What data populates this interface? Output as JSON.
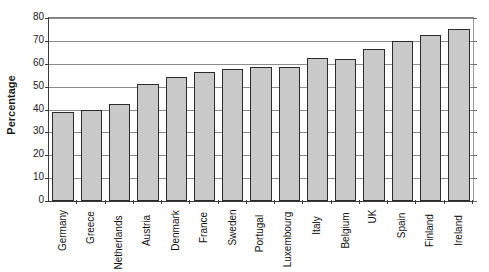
{
  "chart_data": {
    "type": "bar",
    "title": "",
    "xlabel": "",
    "ylabel": "Percentage",
    "ylim": [
      0,
      80
    ],
    "yticks": [
      0,
      10,
      20,
      30,
      40,
      50,
      60,
      70,
      80
    ],
    "grid": true,
    "legend": null,
    "orientation": "vertical",
    "bar_color": "#c9c9c9",
    "bar_edge_color": "#2b2b2b",
    "categories": [
      "Germany",
      "Greece",
      "Netherlands",
      "Austria",
      "Denmark",
      "France",
      "Sweden",
      "Portugal",
      "Luxembourg",
      "Italy",
      "Belgium",
      "UK",
      "Spain",
      "Finland",
      "Ireland"
    ],
    "values": [
      39,
      40,
      42.5,
      51,
      54,
      56.5,
      57.5,
      58.5,
      58.5,
      62.5,
      62,
      66.5,
      70,
      72.5,
      75
    ]
  }
}
